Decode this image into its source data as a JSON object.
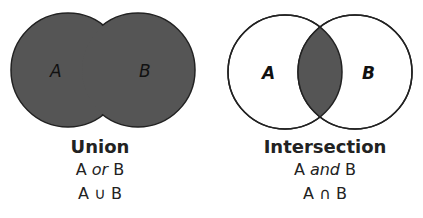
{
  "union": {
    "label_a": "A",
    "label_b": "B",
    "title": "Union",
    "phrase_pre": "A ",
    "phrase_word": "or",
    "phrase_post": " B",
    "notation": "A ∪ B",
    "fill": "#555555"
  },
  "intersection": {
    "label_a": "A",
    "label_b": "B",
    "title": "Intersection",
    "phrase_pre": "A ",
    "phrase_word": "and",
    "phrase_post": " B",
    "notation": "A ∩ B",
    "fill": "#555555"
  }
}
